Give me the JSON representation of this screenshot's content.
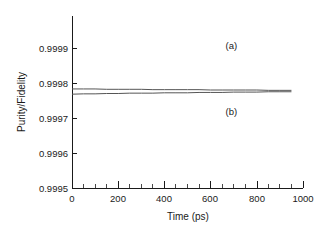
{
  "chart_data": {
    "type": "line",
    "title": "",
    "xlabel": "Time (ps)",
    "ylabel": "Purity/Fidelity",
    "xlim": [
      0,
      1000
    ],
    "ylim": [
      0.9995,
      0.99993
    ],
    "grid": false,
    "legend_position": "inline-annotations",
    "x_ticks": [
      0,
      200,
      400,
      600,
      800,
      1000
    ],
    "x_tick_labels": [
      "0",
      "200",
      "400",
      "600",
      "800",
      "1000"
    ],
    "x_minor_tick_interval": 50,
    "y_ticks": [
      0.9995,
      0.9996,
      0.9997,
      0.9998,
      0.9999
    ],
    "y_tick_labels": [
      "0.9995",
      "0.9996",
      "0.9997",
      "0.9998",
      "0.9999"
    ],
    "x": [
      0,
      50,
      100,
      150,
      200,
      250,
      300,
      350,
      400,
      450,
      500,
      550,
      600,
      650,
      700,
      750,
      800,
      850,
      900,
      950
    ],
    "series": [
      {
        "name": "(a)",
        "label": "(a)",
        "color": "#555555",
        "values": [
          0.999783,
          0.999783,
          0.999783,
          0.999782,
          0.999782,
          0.999782,
          0.999782,
          0.999781,
          0.999781,
          0.999781,
          0.999781,
          0.999781,
          0.99978,
          0.99978,
          0.99978,
          0.99978,
          0.99978,
          0.999779,
          0.999779,
          0.999779
        ]
      },
      {
        "name": "(b)",
        "label": "(b)",
        "color": "#555555",
        "values": [
          0.999768,
          0.999769,
          0.999769,
          0.99977,
          0.99977,
          0.999771,
          0.999771,
          0.999771,
          0.999772,
          0.999772,
          0.999772,
          0.999773,
          0.999773,
          0.999773,
          0.999774,
          0.999774,
          0.999774,
          0.999775,
          0.999775,
          0.999775
        ]
      }
    ],
    "annotations": [
      {
        "text": "(a)",
        "x": 690,
        "y": 0.999905
      },
      {
        "text": "(b)",
        "x": 690,
        "y": 0.999717
      }
    ]
  }
}
